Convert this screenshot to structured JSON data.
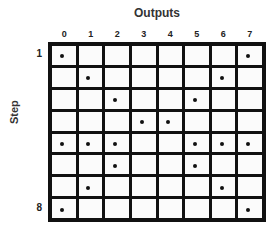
{
  "diagram": {
    "title": "Outputs",
    "y_axis_label": "Step",
    "columns": [
      "0",
      "1",
      "2",
      "3",
      "4",
      "5",
      "6",
      "7"
    ],
    "row_labels": [
      {
        "row": 0,
        "label": "1"
      },
      {
        "row": 7,
        "label": "8"
      }
    ],
    "num_rows": 8,
    "active_cells": [
      [
        0,
        7
      ],
      [
        1,
        6
      ],
      [
        2,
        5
      ],
      [
        3,
        4
      ],
      [
        0,
        1,
        2,
        5,
        6,
        7
      ],
      [
        2,
        5
      ],
      [
        1,
        6
      ],
      [
        0,
        7
      ]
    ],
    "colors": {
      "grid_line": "#111111",
      "cell_background": "#fbfbfb",
      "dot": "#111111"
    }
  }
}
